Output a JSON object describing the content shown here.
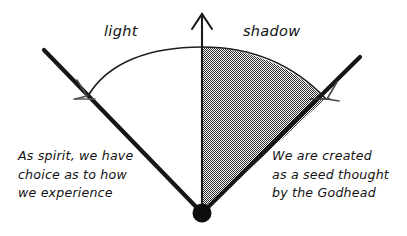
{
  "diagram": {
    "labels": {
      "light": "light",
      "shadow": "shadow"
    },
    "notes": {
      "left": {
        "lines": [
          "As spirit, we have",
          "choice as to how",
          "we experience"
        ]
      },
      "right": {
        "lines": [
          "We are created",
          "as a seed thought",
          "by the Godhead"
        ]
      }
    },
    "icons": {
      "up_arrow": "up-arrow-icon",
      "apex_dot": "apex-dot-icon",
      "arc_arrow_left": "arc-arrowhead-left-icon",
      "arc_arrow_right": "arc-arrowhead-right-icon"
    },
    "colors": {
      "ink": "#111111",
      "stroke": "#1a1a1a",
      "shading": "#8c8c8c",
      "background": "#ffffff",
      "thin_stroke": "#444444"
    },
    "geometry": {
      "apex": {
        "x": 202,
        "y": 213
      },
      "apex_dot_radius": 9,
      "left_ray_end": {
        "x": 44,
        "y": 50
      },
      "right_ray_end": {
        "x": 360,
        "y": 57
      },
      "axis_top": {
        "x": 202,
        "y": 12
      },
      "arc_left_end": {
        "x": 88,
        "y": 96
      },
      "arc_right_end": {
        "x": 316,
        "y": 97
      },
      "arc_apex": {
        "x": 202,
        "y": 48
      },
      "shaded_side": "right"
    }
  }
}
